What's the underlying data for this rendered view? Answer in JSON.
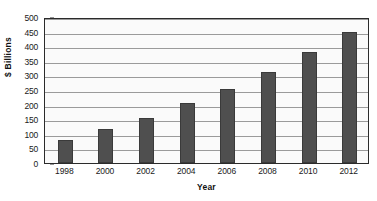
{
  "chart_data": {
    "type": "bar",
    "title": "",
    "xlabel": "Year",
    "ylabel": "$ Billions",
    "categories": [
      "1998",
      "2000",
      "2002",
      "2004",
      "2006",
      "2008",
      "2010",
      "2012"
    ],
    "values": [
      80,
      115,
      155,
      205,
      255,
      310,
      380,
      450
    ],
    "ylim": [
      0,
      500
    ],
    "ytick_labels": [
      "0",
      "50",
      "100",
      "150",
      "200",
      "250",
      "300",
      "350",
      "400",
      "450",
      "500"
    ],
    "ytick_values": [
      0,
      50,
      100,
      150,
      200,
      250,
      300,
      350,
      400,
      450,
      500
    ],
    "grid": true,
    "legend": false,
    "bar_color": "#4f4f4f",
    "plot_background": "#fafafa",
    "gridline_color": "#9a9a9a",
    "axis_color": "#2b2b2b"
  }
}
